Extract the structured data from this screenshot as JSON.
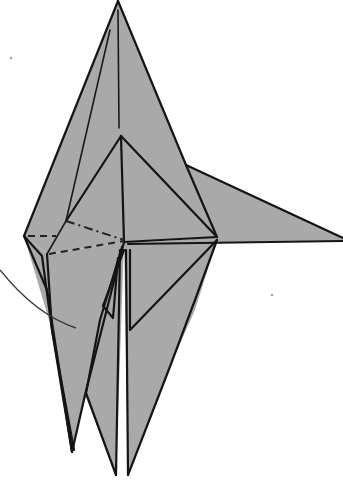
{
  "diagram": {
    "type": "origami-fold-diagram",
    "colors": {
      "paper": "#a9a9a9",
      "line": "#141414",
      "background": "#ffffff"
    },
    "line_types": [
      "edge",
      "crease",
      "valley-fold-dashed",
      "mountain-fold-dash-dot",
      "movement-arrow-curve"
    ],
    "labels": []
  }
}
